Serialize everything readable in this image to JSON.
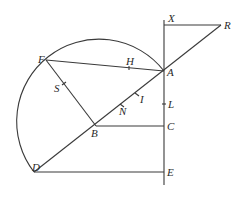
{
  "diagram": {
    "type": "geometric-figure",
    "points": [
      {
        "id": "X",
        "label": "X",
        "x": 164,
        "y": 25,
        "lx": 168,
        "ly": 22
      },
      {
        "id": "R",
        "label": "R",
        "x": 221,
        "y": 25,
        "lx": 224,
        "ly": 29
      },
      {
        "id": "F",
        "label": "F",
        "x": 46,
        "y": 60,
        "lx": 38,
        "ly": 60
      },
      {
        "id": "H",
        "label": "H",
        "x": 129,
        "y": 68,
        "lx": 126,
        "ly": 65
      },
      {
        "id": "A",
        "label": "A",
        "x": 164,
        "y": 71,
        "lx": 167,
        "ly": 76
      },
      {
        "id": "S",
        "label": "S",
        "x": 64,
        "y": 84,
        "lx": 54,
        "ly": 92
      },
      {
        "id": "I",
        "label": "I",
        "x": 137,
        "y": 94,
        "lx": 139,
        "ly": 103
      },
      {
        "id": "N",
        "label": "N",
        "x": 122,
        "y": 105,
        "lx": 120,
        "ly": 115
      },
      {
        "id": "L",
        "label": "L",
        "x": 164,
        "y": 104,
        "lx": 168,
        "ly": 108
      },
      {
        "id": "B",
        "label": "B",
        "x": 96,
        "y": 126,
        "lx": 91,
        "ly": 135
      },
      {
        "id": "C",
        "label": "C",
        "x": 164,
        "y": 126,
        "lx": 167,
        "ly": 130
      },
      {
        "id": "D",
        "label": "D",
        "x": 34,
        "y": 172,
        "lx": 32,
        "ly": 170
      },
      {
        "id": "E",
        "label": "E",
        "x": 164,
        "y": 172,
        "lx": 167,
        "ly": 176
      }
    ],
    "segments": [
      "X-E (vertical axis)",
      "X-R",
      "R-D (through A, I, N, B)",
      "F-A (through H)",
      "F-B (through S)",
      "B-C",
      "D-E"
    ],
    "arc": {
      "from": "D",
      "through": "F",
      "to": "A",
      "center": [
        100,
        122
      ],
      "radius": 82
    }
  }
}
